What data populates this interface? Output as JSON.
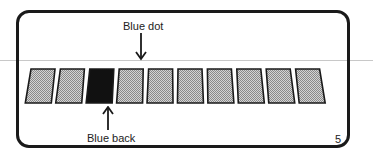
{
  "figure": {
    "frame": {
      "border_color": "#1a1a1a"
    },
    "cards": {
      "count": 10,
      "items": [
        {
          "index": 1,
          "state": "face-down-gray",
          "fill": "#b8b8b8"
        },
        {
          "index": 2,
          "state": "face-down-gray",
          "fill": "#b8b8b8"
        },
        {
          "index": 3,
          "state": "blue-back",
          "fill": "#111111"
        },
        {
          "index": 4,
          "state": "blue-dot",
          "fill": "#b8b8b8"
        },
        {
          "index": 5,
          "state": "face-down-gray",
          "fill": "#b8b8b8"
        },
        {
          "index": 6,
          "state": "face-down-gray",
          "fill": "#b8b8b8"
        },
        {
          "index": 7,
          "state": "face-down-gray",
          "fill": "#b8b8b8"
        },
        {
          "index": 8,
          "state": "face-down-gray",
          "fill": "#b8b8b8"
        },
        {
          "index": 9,
          "state": "face-down-gray",
          "fill": "#b8b8b8"
        },
        {
          "index": 10,
          "state": "face-down-gray",
          "fill": "#b8b8b8"
        }
      ]
    },
    "annotations": {
      "top_label": "Blue dot",
      "bottom_label": "Blue back"
    },
    "page_number": "5"
  }
}
